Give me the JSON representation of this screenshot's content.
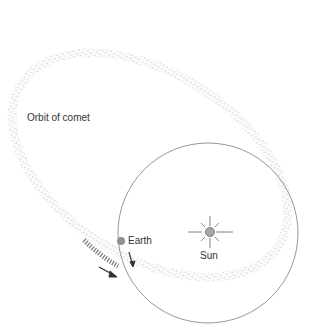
{
  "diagram": {
    "labels": {
      "comet_orbit": "Orbit of comet",
      "earth": "Earth",
      "sun": "Sun"
    },
    "colors": {
      "background": "#ffffff",
      "earth_orbit": "#8a8a8a",
      "comet_dots": "#7a7a7a",
      "earth": "#909090",
      "sun": "#a8a8a8",
      "arrow": "#333333"
    },
    "icons": [
      "sun-rays-icon",
      "earth-dot-icon",
      "direction-arrow-icon"
    ]
  }
}
